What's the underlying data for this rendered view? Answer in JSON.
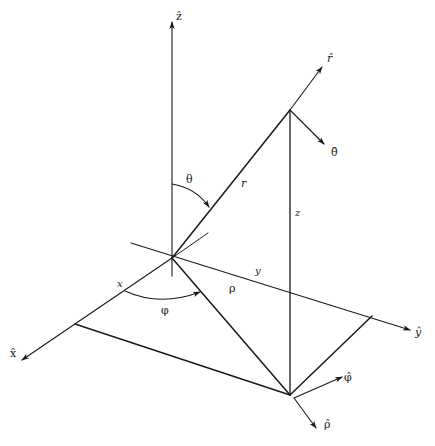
{
  "diagram": {
    "colors": {
      "stroke": "#1a1a1a",
      "background": "#ffffff"
    },
    "axes": {
      "z_hat": "ẑ",
      "x_hat": "x̂",
      "y_hat": "ŷ"
    },
    "unit_vectors": {
      "r_hat": "r̂",
      "theta_hat": "θ̂",
      "phi_hat": "φ̂",
      "rho_hat": "ρ̂"
    },
    "quantities": {
      "r": "r",
      "z": "z",
      "x": "x",
      "y": "y",
      "rho": "ρ",
      "theta": "θ",
      "phi": "φ"
    }
  }
}
